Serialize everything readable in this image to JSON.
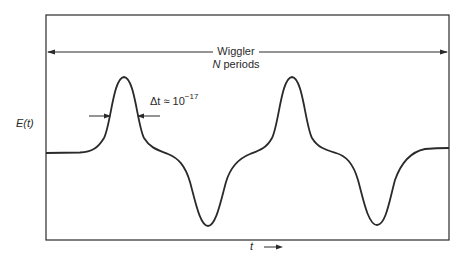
{
  "figure": {
    "wiggler_label": "Wiggler",
    "periods_label_var": "N",
    "periods_label_text": " periods",
    "pulse_width_label": "Δt ≈ 10",
    "pulse_width_exponent": "−17",
    "y_axis_label": "E(t)",
    "x_axis_label": "t",
    "x_axis_arrow": "→"
  },
  "colors": {
    "line": "#2a2a2a",
    "background": "#ffffff"
  }
}
